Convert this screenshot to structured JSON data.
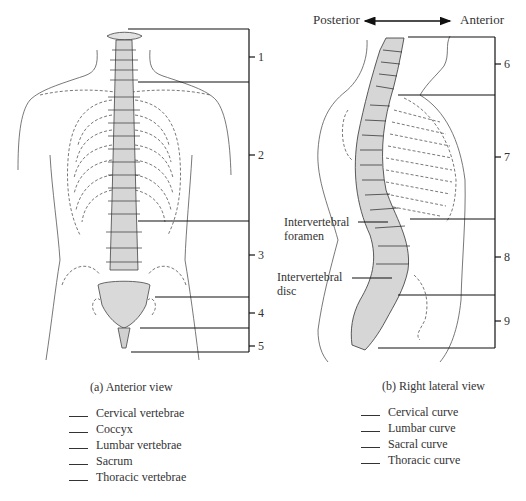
{
  "orientation": {
    "posterior_label": "Posterior",
    "anterior_label": "Anterior"
  },
  "anterior_view": {
    "caption": "(a) Anterior view",
    "bracket_numbers": [
      "1",
      "2",
      "3",
      "4",
      "5"
    ],
    "answer_options": [
      "Cervical vertebrae",
      "Coccyx",
      "Lumbar vertebrae",
      "Sacrum",
      "Thoracic vertebrae"
    ]
  },
  "lateral_view": {
    "caption": "(b) Right lateral view",
    "bracket_numbers": [
      "6",
      "7",
      "8",
      "9"
    ],
    "callouts": {
      "foramen_line1": "Intervertebral",
      "foramen_line2": "foramen",
      "disc_line1": "Intervertebral",
      "disc_line2": "disc"
    },
    "answer_options": [
      "Cervical curve",
      "Lumbar curve",
      "Sacral curve",
      "Thoracic curve"
    ]
  },
  "colors": {
    "line": "#222222",
    "bone_fill": "#d9d9d9",
    "outline": "#555555"
  }
}
